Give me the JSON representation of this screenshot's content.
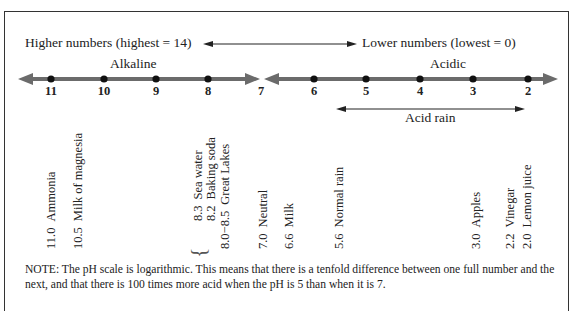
{
  "header": {
    "higher_label": "Higher numbers  (highest = 14)",
    "lower_label": "Lower numbers  (lowest = 0)"
  },
  "regions": {
    "alkaline": "Alkaline",
    "acidic": "Acidic",
    "acid_rain": "Acid rain"
  },
  "scale_ticks": [
    "11",
    "10",
    "9",
    "8",
    "7",
    "6",
    "5",
    "4",
    "3",
    "2"
  ],
  "substances": [
    {
      "value": "11.0",
      "name": "Ammonia"
    },
    {
      "value": "10.5",
      "name": "Milk of magnesia"
    },
    {
      "value": "8.3",
      "name": "Sea water"
    },
    {
      "value": "8.2",
      "name": "Baking soda"
    },
    {
      "value": "8.0−8.5",
      "name": "Great Lakes"
    },
    {
      "value": "7.0",
      "name": "Neutral"
    },
    {
      "value": "6.6",
      "name": "Milk"
    },
    {
      "value": "5.6",
      "name": "Normal rain"
    },
    {
      "value": "3.0",
      "name": "Apples"
    },
    {
      "value": "2.2",
      "name": "Vinegar"
    },
    {
      "value": "2.0",
      "name": "Lemon juice"
    }
  ],
  "note": "NOTE: The pH scale is logarithmic. This means that there is a tenfold difference between one full number and the next, and that there is 100 times more acid when the pH is 5 than when it is 7.",
  "colors": {
    "scale_line": "#6b6b6b",
    "dot": "#111111",
    "text": "#222222"
  }
}
